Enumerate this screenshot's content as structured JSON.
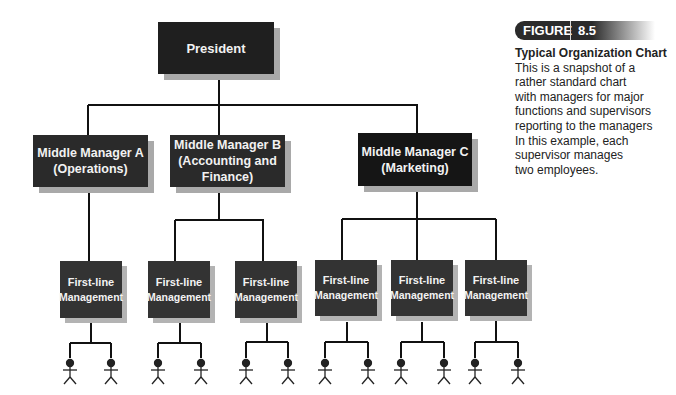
{
  "figure": {
    "label": "FIGURE",
    "number": "8.5",
    "caption_title": "Typical Organization Chart",
    "caption_lines": [
      "This is a snapshot of a",
      "rather standard chart",
      "with managers for major",
      "functions and supervisors",
      "reporting to the managers",
      "In this example, each",
      "supervisor manages",
      "two employees."
    ]
  },
  "org": {
    "president": "President",
    "managers": [
      {
        "lines": [
          "Middle Manager A",
          "(Operations)"
        ]
      },
      {
        "lines": [
          "Middle Manager B",
          "(Accounting and",
          "Finance)"
        ]
      },
      {
        "lines": [
          "Middle Manager C",
          "(Marketing)"
        ]
      }
    ],
    "first_line": {
      "line1": "First-line",
      "line2": "Management",
      "count": 6
    },
    "employees_per_supervisor": 2
  },
  "colors": {
    "box": "#1f1f1f",
    "shadow": "#a9a9a9",
    "line": "#111111",
    "text_on_box": "#f2f2f2"
  }
}
